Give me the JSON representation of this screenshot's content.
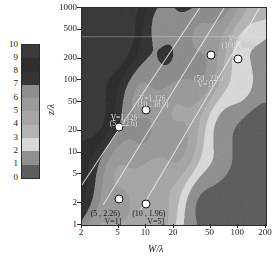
{
  "chart_data": {
    "type": "heatmap",
    "title": "",
    "xlabel": "W/λ",
    "ylabel": "z/λ",
    "xscale": "log",
    "yscale": "log",
    "xlim": [
      2,
      200
    ],
    "ylim": [
      1,
      1000
    ],
    "xticks": [
      "2",
      "5",
      "10",
      "20",
      "50",
      "100",
      "200"
    ],
    "xtick_values": [
      2,
      5,
      10,
      20,
      50,
      100,
      200
    ],
    "yticks": [
      "1",
      "2",
      "5",
      "10",
      "20",
      "50",
      "100",
      "200",
      "500",
      "1000"
    ],
    "ytick_values": [
      1,
      2,
      5,
      10,
      20,
      50,
      100,
      200,
      500,
      1000
    ],
    "grid": false,
    "legend": "none",
    "colorbar": {
      "ticks": [
        "10",
        "9",
        "8",
        "7",
        "6",
        "5",
        "4",
        "3",
        "2",
        "1",
        "0"
      ],
      "tick_values": [
        10,
        9,
        8,
        7,
        6,
        5,
        4,
        3,
        2,
        1,
        0
      ],
      "min": 0,
      "max": 10,
      "bands": [
        {
          "level": "9-10",
          "color": "#3a3a3a"
        },
        {
          "level": "8-9",
          "color": "#2e2e2e"
        },
        {
          "level": "7-8",
          "color": "#343434"
        },
        {
          "level": "6-7",
          "color": "#8d8d8d"
        },
        {
          "level": "5-6",
          "color": "#9b9b9b"
        },
        {
          "level": "4-5",
          "color": "#a6a6a6"
        },
        {
          "level": "3-4",
          "color": "#b4b4b4"
        },
        {
          "level": "2-3",
          "color": "#d8d8d8"
        },
        {
          "level": "1-2",
          "color": "#909090"
        },
        {
          "level": "0-1",
          "color": "#5e5e5e"
        }
      ]
    },
    "markers": [
      {
        "name": "m1",
        "x": 5,
        "y": 22.6,
        "label_point": "(5 , 22.6)",
        "label_v": "V=1.126"
      },
      {
        "name": "m2",
        "x": 10,
        "y": 38.9,
        "label_point": "(10 , 38.9)",
        "label_v": "V=1.126"
      },
      {
        "name": "m3",
        "x": 50,
        "y": 226,
        "label_point": "(50 , 226)",
        "label_v": "V=11"
      },
      {
        "name": "m4",
        "x": 100,
        "y": 196,
        "label_point": "(100 , 196)",
        "label_v": "V=5]"
      },
      {
        "name": "m5",
        "x": 5,
        "y": 2.26,
        "label_point": "(5 , 2.26)",
        "label_v": "V=1]"
      },
      {
        "name": "m6",
        "x": 10,
        "y": 1.96,
        "label_point": "(10 , 1.96)",
        "label_v": "V=5]"
      }
    ],
    "lines": [
      {
        "name": "line-1",
        "color": "#ffffff"
      },
      {
        "name": "line-2",
        "color": "#ffffff"
      },
      {
        "name": "line-3",
        "color": "#ffffff"
      }
    ]
  }
}
